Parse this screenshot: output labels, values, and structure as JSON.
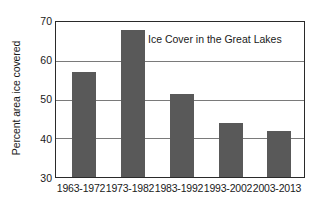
{
  "chart_data": {
    "type": "bar",
    "title": "Ice Cover in the Great Lakes",
    "xlabel": "",
    "ylabel": "Percent area ice covered",
    "categories": [
      "1963-1972",
      "1973-1982",
      "1983-1992",
      "1993-2002",
      "2003-2013"
    ],
    "values": [
      57,
      68,
      51.5,
      44,
      42
    ],
    "ylim": [
      30,
      70
    ],
    "yticks": [
      30,
      40,
      50,
      60,
      70
    ],
    "ytick_labels": [
      "30",
      "40",
      "50",
      "60",
      "70"
    ],
    "grid": true,
    "legend": "none",
    "bar_color": "#595959",
    "axis_color": "#2a2a2a",
    "gridline_color": "#7a7a7a",
    "background_color": "#ffffff"
  }
}
